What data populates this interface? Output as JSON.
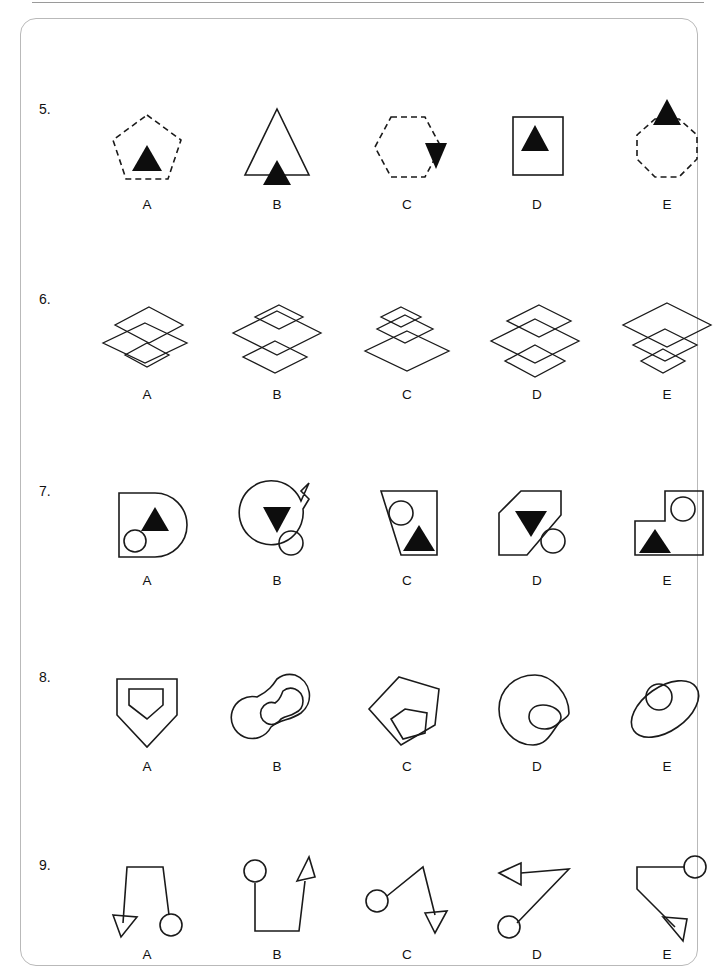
{
  "page": {
    "frame_color": "#b9b9b9",
    "ink_color": "#1a1a1a",
    "background": "#ffffff"
  },
  "options_labels": [
    "A",
    "B",
    "C",
    "D",
    "E"
  ],
  "rows": [
    {
      "number": "5.",
      "items": [
        {
          "label": "A",
          "description": "dashed pentagon containing a small solid up-triangle"
        },
        {
          "label": "B",
          "description": "solid-outline tall triangle with solid up-triangle straddling its base"
        },
        {
          "label": "C",
          "description": "dashed hexagon with solid down-triangle on its right edge"
        },
        {
          "label": "D",
          "description": "solid square containing a solid up-triangle"
        },
        {
          "label": "E",
          "description": "dashed octagon with solid up-triangle on its top edge"
        }
      ]
    },
    {
      "number": "6.",
      "items": [
        {
          "label": "A",
          "description": "three overlapping diamonds: medium top, large middle, small bottom"
        },
        {
          "label": "B",
          "description": "three overlapping diamonds: small top, large middle, medium bottom"
        },
        {
          "label": "C",
          "description": "three overlapping diamonds: small top, medium middle, large bottom"
        },
        {
          "label": "D",
          "description": "three overlapping diamonds: medium top, large middle, medium bottom"
        },
        {
          "label": "E",
          "description": "three overlapping diamonds: large top, medium middle, small bottom"
        }
      ]
    },
    {
      "number": "7.",
      "items": [
        {
          "label": "A",
          "description": "D-shape with solid up-triangle and outline circle inside"
        },
        {
          "label": "B",
          "description": "circle with tab at top-right, solid down-triangle and outline circle inside"
        },
        {
          "label": "C",
          "description": "trapezium with outline circle and solid up-triangle inside"
        },
        {
          "label": "D",
          "description": "cut-corner polygon with solid down-triangle inside and outline circle in lower right notch"
        },
        {
          "label": "E",
          "description": "L-shaped polygon with outline circle upper right and solid up-triangle lower left"
        }
      ]
    },
    {
      "number": "8.",
      "items": [
        {
          "label": "A",
          "description": "home-plate pentagon containing a smaller home-plate pentagon"
        },
        {
          "label": "B",
          "description": "figure-eight blob containing a smaller figure-eight blob"
        },
        {
          "label": "C",
          "description": "irregular pentagon containing a smaller irregular pentagon"
        },
        {
          "label": "D",
          "description": "teardrop blob containing a smaller rounded blob"
        },
        {
          "label": "E",
          "description": "tilted ellipse containing a circle"
        }
      ]
    },
    {
      "number": "9.",
      "items": [
        {
          "label": "A",
          "description": "bent line, open arrowhead at lower left, open circle at lower right"
        },
        {
          "label": "B",
          "description": "open circle top-left, bent line, open arrowhead pointing up-right"
        },
        {
          "label": "C",
          "description": "open circle left, bent line, open arrowhead pointing down-right"
        },
        {
          "label": "D",
          "description": "open arrowhead pointing left, bent line, open circle at lower left"
        },
        {
          "label": "E",
          "description": "open circle top-right, bent line, open arrowhead pointing down-right"
        }
      ]
    }
  ]
}
